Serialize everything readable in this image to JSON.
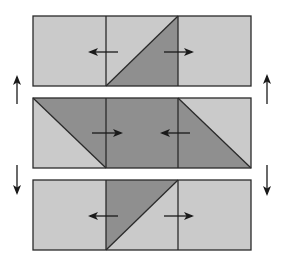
{
  "colors": {
    "background": "#ffffff",
    "light": "#cacaca",
    "dark": "#8f8f8f",
    "stroke": "#2a2a2a",
    "arrow": "#1a1a1a"
  },
  "panels": [
    {
      "name": "top",
      "box": {
        "x": 33,
        "y": 16,
        "w": 218,
        "h": 70
      },
      "dividers": [
        106,
        178
      ],
      "dark_polygons": [
        [
          [
            106,
            86
          ],
          [
            178,
            16
          ],
          [
            178,
            86
          ]
        ]
      ],
      "diagonals": [
        [
          [
            106,
            86
          ],
          [
            178,
            16
          ]
        ]
      ],
      "arrows": [
        {
          "x1": 118,
          "y1": 52,
          "x2": 90,
          "y2": 52,
          "direction": "left"
        },
        {
          "x1": 164,
          "y1": 52,
          "x2": 192,
          "y2": 52,
          "direction": "right"
        }
      ]
    },
    {
      "name": "middle",
      "box": {
        "x": 33,
        "y": 98,
        "w": 218,
        "h": 70
      },
      "dividers": [
        106,
        178
      ],
      "dark_polygons": [
        [
          [
            33,
            98
          ],
          [
            178,
            98
          ],
          [
            251,
            168
          ],
          [
            106,
            168
          ]
        ]
      ],
      "diagonals": [
        [
          [
            33,
            98
          ],
          [
            106,
            168
          ]
        ],
        [
          [
            178,
            98
          ],
          [
            251,
            168
          ]
        ]
      ],
      "arrows": [
        {
          "x1": 92,
          "y1": 133,
          "x2": 121,
          "y2": 133,
          "direction": "right"
        },
        {
          "x1": 190,
          "y1": 133,
          "x2": 162,
          "y2": 133,
          "direction": "left"
        }
      ]
    },
    {
      "name": "bottom",
      "box": {
        "x": 33,
        "y": 180,
        "w": 218,
        "h": 70
      },
      "dividers": [
        106,
        178
      ],
      "dark_polygons": [
        [
          [
            106,
            180
          ],
          [
            178,
            180
          ],
          [
            106,
            250
          ]
        ]
      ],
      "diagonals": [
        [
          [
            106,
            250
          ],
          [
            178,
            180
          ]
        ]
      ],
      "arrows": [
        {
          "x1": 118,
          "y1": 216,
          "x2": 90,
          "y2": 216,
          "direction": "left"
        },
        {
          "x1": 164,
          "y1": 216,
          "x2": 192,
          "y2": 216,
          "direction": "right"
        }
      ]
    }
  ],
  "side_arrows": [
    {
      "x1": 17,
      "y1": 104,
      "x2": 17,
      "y2": 77,
      "direction": "up",
      "side": "left"
    },
    {
      "x1": 267,
      "y1": 104,
      "x2": 267,
      "y2": 76,
      "direction": "up",
      "side": "right"
    },
    {
      "x1": 17,
      "y1": 165,
      "x2": 17,
      "y2": 193,
      "direction": "down",
      "side": "left"
    },
    {
      "x1": 267,
      "y1": 165,
      "x2": 267,
      "y2": 194,
      "direction": "down",
      "side": "right"
    }
  ]
}
